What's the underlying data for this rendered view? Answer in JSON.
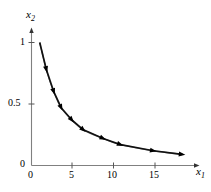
{
  "figure": {
    "width": 211,
    "height": 192,
    "background": "#ffffff",
    "foreground": "#000000",
    "curve_color": "#808080",
    "marker_color": "#000000"
  },
  "axes": {
    "x_label": "x",
    "x_label_sub": "1",
    "y_label": "x",
    "y_label_sub": "2",
    "x_ticks": [
      "0",
      "5",
      "10",
      "15"
    ],
    "y_ticks": [
      "0",
      "0.5",
      "1"
    ]
  },
  "chart_data": {
    "type": "line",
    "title": "",
    "xlabel": "x1",
    "ylabel": "x2",
    "xlim": [
      0,
      19.5
    ],
    "ylim": [
      0,
      1.12
    ],
    "xticks": [
      0,
      5,
      10,
      15
    ],
    "yticks": [
      0,
      0.5,
      1
    ],
    "grid": false,
    "legend": false,
    "markers": "triangle",
    "series": [
      {
        "name": "curve",
        "x": [
          1.0,
          1.8,
          2.7,
          3.6,
          4.9,
          6.3,
          8.7,
          10.8,
          14.8,
          18.3
        ],
        "y": [
          1.0,
          0.78,
          0.6,
          0.47,
          0.37,
          0.29,
          0.22,
          0.17,
          0.12,
          0.09
        ]
      }
    ],
    "annotations": []
  }
}
